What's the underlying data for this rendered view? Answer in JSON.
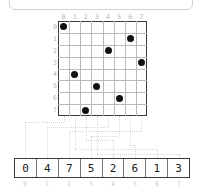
{
  "panel": {
    "content": ""
  },
  "grid": {
    "size": 8,
    "col_headers": [
      "0",
      "1",
      "2",
      "3",
      "4",
      "5",
      "6",
      "7"
    ],
    "row_headers": [
      "0",
      "1",
      "2",
      "3",
      "4",
      "5",
      "6",
      "7"
    ],
    "dots": [
      {
        "row": 0,
        "col": 0
      },
      {
        "row": 1,
        "col": 6
      },
      {
        "row": 2,
        "col": 4
      },
      {
        "row": 3,
        "col": 7
      },
      {
        "row": 4,
        "col": 1
      },
      {
        "row": 5,
        "col": 3
      },
      {
        "row": 6,
        "col": 5
      },
      {
        "row": 7,
        "col": 2
      }
    ]
  },
  "output_bar": {
    "values": [
      "0",
      "4",
      "7",
      "5",
      "2",
      "6",
      "1",
      "3"
    ],
    "indices": [
      "0",
      "1",
      "2",
      "3",
      "4",
      "5",
      "6",
      "7"
    ]
  },
  "colors": {
    "dot": "#111111",
    "grid_line": "#b9b9b9",
    "grid_border": "#3a3a3a",
    "label": "#b5b5b5",
    "wire": "#d8d8d8",
    "bar_border": "#3c3c3c",
    "bar_text": "#1a1a1a"
  }
}
